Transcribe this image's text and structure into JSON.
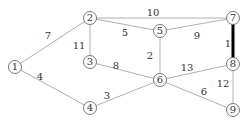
{
  "graph": {
    "nodes": [
      {
        "id": "1",
        "x": 15,
        "y": 67
      },
      {
        "id": "2",
        "x": 90,
        "y": 18
      },
      {
        "id": "3",
        "x": 90,
        "y": 62
      },
      {
        "id": "4",
        "x": 90,
        "y": 108
      },
      {
        "id": "5",
        "x": 160,
        "y": 31
      },
      {
        "id": "6",
        "x": 160,
        "y": 80
      },
      {
        "id": "7",
        "x": 233,
        "y": 18
      },
      {
        "id": "8",
        "x": 233,
        "y": 64
      },
      {
        "id": "9",
        "x": 233,
        "y": 110
      }
    ],
    "edges": [
      {
        "from": "1",
        "to": "2",
        "weight": "7",
        "lx": 48,
        "ly": 36,
        "bold": false
      },
      {
        "from": "1",
        "to": "4",
        "weight": "4",
        "lx": 40,
        "ly": 77,
        "bold": false
      },
      {
        "from": "2",
        "to": "3",
        "weight": "11",
        "lx": 79,
        "ly": 46,
        "bold": false
      },
      {
        "from": "2",
        "to": "5",
        "weight": "5",
        "lx": 125,
        "ly": 33,
        "bold": false
      },
      {
        "from": "2",
        "to": "7",
        "weight": "10",
        "lx": 153,
        "ly": 13,
        "bold": false
      },
      {
        "from": "3",
        "to": "6",
        "weight": "8",
        "lx": 116,
        "ly": 66,
        "bold": false
      },
      {
        "from": "4",
        "to": "6",
        "weight": "3",
        "lx": 107,
        "ly": 96,
        "bold": false
      },
      {
        "from": "5",
        "to": "6",
        "weight": "2",
        "lx": 150,
        "ly": 56,
        "bold": false
      },
      {
        "from": "5",
        "to": "7",
        "weight": "9",
        "lx": 197,
        "ly": 36,
        "bold": false
      },
      {
        "from": "7",
        "to": "8",
        "weight": "1",
        "lx": 228,
        "ly": 44,
        "bold": true
      },
      {
        "from": "6",
        "to": "8",
        "weight": "13",
        "lx": 187,
        "ly": 68,
        "bold": false
      },
      {
        "from": "6",
        "to": "9",
        "weight": "6",
        "lx": 204,
        "ly": 92,
        "bold": false
      },
      {
        "from": "8",
        "to": "9",
        "weight": "12",
        "lx": 223,
        "ly": 84,
        "bold": false
      }
    ]
  }
}
